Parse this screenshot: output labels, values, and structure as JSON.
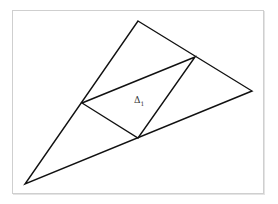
{
  "diagram": {
    "outer_triangle": {
      "vertices": [
        "top",
        "right",
        "bottom-left"
      ]
    },
    "medial_triangle": {
      "vertices": [
        "midpoint-top-right-edge",
        "midpoint-left-edge",
        "midpoint-bottom-edge"
      ]
    },
    "label": {
      "symbol": "Δ",
      "subscript": "1",
      "placement": "inside medial triangle"
    },
    "line_color": "#111111",
    "frame_color": "#cfcfcf"
  }
}
